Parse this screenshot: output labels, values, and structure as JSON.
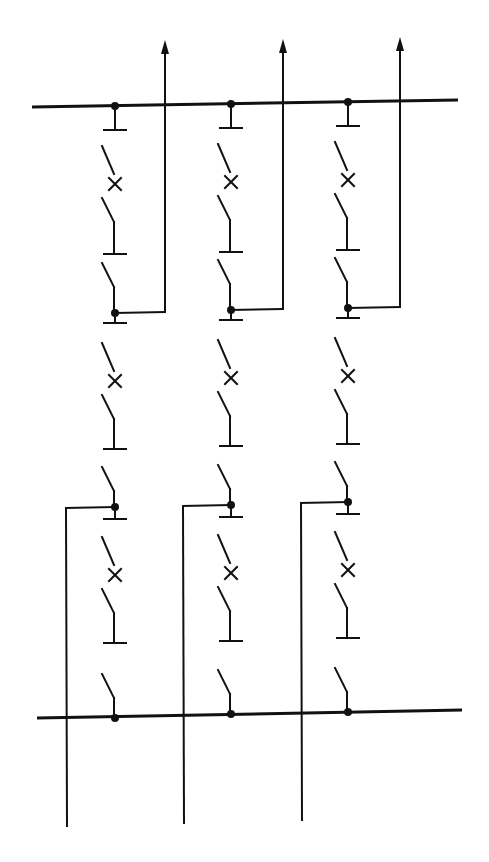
{
  "diagram": {
    "type": "electrical-single-line",
    "stroke_color": "#111111",
    "background": "#ffffff",
    "buses": [
      {
        "id": "bus-top",
        "x1": 32,
        "y1": 107,
        "x2": 458,
        "y2": 100
      },
      {
        "id": "bus-bottom",
        "x1": 37,
        "y1": 718,
        "x2": 462,
        "y2": 710
      }
    ],
    "bays": [
      {
        "id": "bay-1",
        "x": 115,
        "top_y": 106,
        "bottom_y": 718,
        "upper_feeder": {
          "node_y": 313,
          "line_x": 165,
          "arrow_top_y": 40,
          "direction": "up"
        },
        "lower_feeder": {
          "node_y": 507,
          "line_x": 66,
          "end_y": 826,
          "direction": "down"
        }
      },
      {
        "id": "bay-2",
        "x": 231,
        "top_y": 104,
        "bottom_y": 714,
        "upper_feeder": {
          "node_y": 310,
          "line_x": 283,
          "arrow_top_y": 39,
          "direction": "up"
        },
        "lower_feeder": {
          "node_y": 505,
          "line_x": 183,
          "end_y": 823,
          "direction": "down"
        }
      },
      {
        "id": "bay-3",
        "x": 348,
        "top_y": 102,
        "bottom_y": 712,
        "upper_feeder": {
          "node_y": 308,
          "line_x": 400,
          "arrow_top_y": 37,
          "direction": "up"
        },
        "lower_feeder": {
          "node_y": 502,
          "line_x": 301,
          "end_y": 820,
          "direction": "down"
        }
      }
    ],
    "symbols": {
      "disconnector": "angled-blade-switch",
      "breaker": "x-marked-switch",
      "node": "filled-dot",
      "terminal": "t-bar"
    },
    "caption": ""
  }
}
